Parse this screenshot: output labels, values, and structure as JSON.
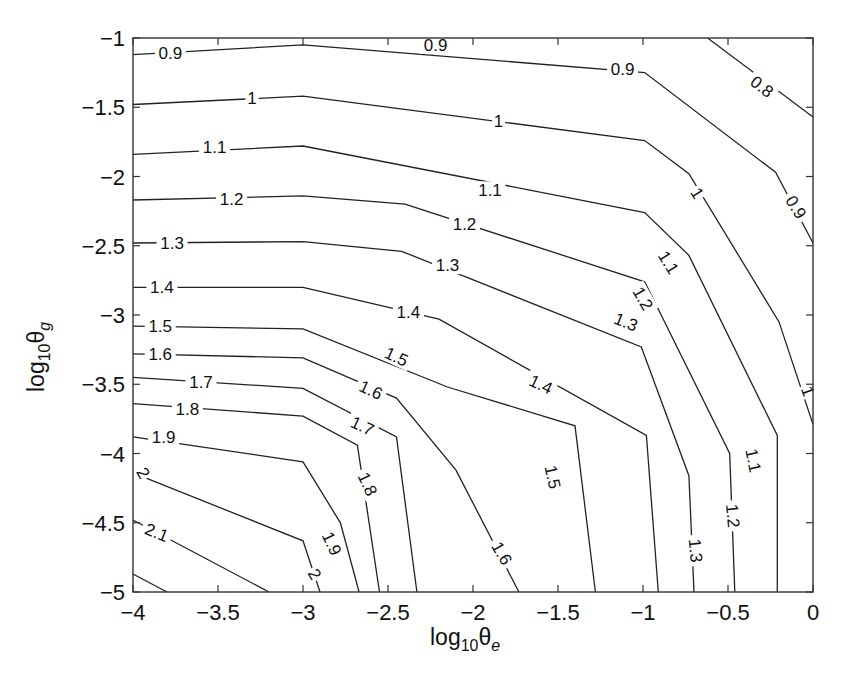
{
  "chart_data": {
    "type": "contour",
    "title": "",
    "xlabel": "log10 θe",
    "ylabel": "log10 θg",
    "xlim": [
      -4,
      0
    ],
    "ylim": [
      -5,
      -1
    ],
    "grid": false,
    "x_ticks": [
      -4,
      -3.5,
      -3,
      -2.5,
      -2,
      -1.5,
      -1,
      -0.5,
      0
    ],
    "x_tick_labels": [
      "−4",
      "−3.5",
      "−3",
      "−2.5",
      "−2",
      "−1.5",
      "−1",
      "−0.5",
      "0"
    ],
    "y_ticks": [
      -1,
      -1.5,
      -2,
      -2.5,
      -3,
      -3.5,
      -4,
      -4.5,
      -5
    ],
    "y_tick_labels": [
      "−1",
      "−1.5",
      "−2",
      "−2.5",
      "−3",
      "−3.5",
      "−4",
      "−4.5",
      "−5"
    ],
    "contour_levels": [
      0.8,
      0.9,
      1.0,
      1.1,
      1.2,
      1.3,
      1.4,
      1.5,
      1.6,
      1.7,
      1.8,
      1.9,
      2.0,
      2.1
    ],
    "contours": [
      {
        "level": 0.8,
        "label": "0.8",
        "points": [
          [
            -0.62,
            -1.0
          ],
          [
            0,
            -1.57
          ]
        ],
        "labels_at": [
          [
            -0.3,
            -1.35,
            38
          ]
        ]
      },
      {
        "level": 0.9,
        "label": "0.9",
        "points": [
          [
            -4,
            -1.12
          ],
          [
            -3,
            -1.05
          ],
          [
            -0.99,
            -1.25
          ],
          [
            -0.22,
            -1.97
          ],
          [
            0,
            -2.48
          ]
        ],
        "labels_at": [
          [
            -3.78,
            -1.11,
            0
          ],
          [
            -2.22,
            -1.05,
            0
          ],
          [
            -1.12,
            -1.22,
            0
          ],
          [
            -0.1,
            -2.22,
            58
          ]
        ]
      },
      {
        "level": 1.0,
        "label": "1",
        "points": [
          [
            -4,
            -1.48
          ],
          [
            -3,
            -1.42
          ],
          [
            -0.99,
            -1.74
          ],
          [
            -0.73,
            -1.98
          ],
          [
            -0.2,
            -3.05
          ],
          [
            0,
            -3.79
          ]
        ],
        "labels_at": [
          [
            -3.3,
            -1.43,
            0
          ],
          [
            -1.85,
            -1.6,
            0
          ],
          [
            -0.68,
            -2.12,
            58
          ],
          [
            -0.03,
            -3.55,
            70
          ]
        ]
      },
      {
        "level": 1.1,
        "label": "1.1",
        "points": [
          [
            -4,
            -1.84
          ],
          [
            -3,
            -1.78
          ],
          [
            -0.99,
            -2.26
          ],
          [
            -0.73,
            -2.57
          ],
          [
            -0.21,
            -3.87
          ],
          [
            -0.21,
            -5.0
          ]
        ],
        "labels_at": [
          [
            -3.52,
            -1.79,
            0
          ],
          [
            -1.9,
            -2.1,
            0
          ],
          [
            -0.85,
            -2.62,
            58
          ],
          [
            -0.35,
            -4.05,
            78
          ]
        ]
      },
      {
        "level": 1.2,
        "label": "1.2",
        "points": [
          [
            -4,
            -2.17
          ],
          [
            -3,
            -2.14
          ],
          [
            -2.4,
            -2.2
          ],
          [
            -0.99,
            -2.76
          ],
          [
            -0.49,
            -4.0
          ],
          [
            -0.46,
            -5.0
          ]
        ],
        "labels_at": [
          [
            -3.42,
            -2.16,
            0
          ],
          [
            -2.05,
            -2.34,
            0
          ],
          [
            -1.0,
            -2.88,
            60
          ],
          [
            -0.47,
            -4.45,
            85
          ]
        ]
      },
      {
        "level": 1.3,
        "label": "1.3",
        "points": [
          [
            -4,
            -2.48
          ],
          [
            -3,
            -2.47
          ],
          [
            -2.42,
            -2.54
          ],
          [
            -1.01,
            -3.23
          ],
          [
            -0.73,
            -4.16
          ],
          [
            -0.7,
            -5.0
          ]
        ],
        "labels_at": [
          [
            -3.77,
            -2.48,
            0
          ],
          [
            -2.15,
            -2.64,
            0
          ],
          [
            -1.1,
            -3.05,
            22
          ],
          [
            -0.69,
            -4.7,
            85
          ]
        ]
      },
      {
        "level": 1.4,
        "label": "1.4",
        "points": [
          [
            -4,
            -2.8
          ],
          [
            -3,
            -2.8
          ],
          [
            -2.2,
            -3.03
          ],
          [
            -0.98,
            -3.87
          ],
          [
            -0.91,
            -5.0
          ]
        ],
        "labels_at": [
          [
            -3.83,
            -2.8,
            0
          ],
          [
            -2.38,
            -2.98,
            0
          ],
          [
            -1.6,
            -3.5,
            25
          ]
        ]
      },
      {
        "level": 1.5,
        "label": "1.5",
        "points": [
          [
            -4,
            -3.08
          ],
          [
            -3,
            -3.1
          ],
          [
            -2.15,
            -3.52
          ],
          [
            -1.4,
            -3.8
          ],
          [
            -1.28,
            -5.0
          ]
        ],
        "labels_at": [
          [
            -3.84,
            -3.08,
            0
          ],
          [
            -2.45,
            -3.3,
            25
          ],
          [
            -1.53,
            -4.17,
            78
          ]
        ]
      },
      {
        "level": 1.6,
        "label": "1.6",
        "points": [
          [
            -4,
            -3.28
          ],
          [
            -3,
            -3.31
          ],
          [
            -2.45,
            -3.6
          ],
          [
            -2.1,
            -4.12
          ],
          [
            -1.73,
            -5.0
          ]
        ],
        "labels_at": [
          [
            -3.84,
            -3.28,
            0
          ],
          [
            -2.6,
            -3.54,
            25
          ],
          [
            -1.83,
            -4.72,
            60
          ]
        ]
      },
      {
        "level": 1.7,
        "label": "1.7",
        "points": [
          [
            -4,
            -3.45
          ],
          [
            -3,
            -3.53
          ],
          [
            -2.45,
            -3.88
          ],
          [
            -2.33,
            -5.0
          ]
        ],
        "labels_at": [
          [
            -3.6,
            -3.48,
            0
          ],
          [
            -2.65,
            -3.8,
            25
          ]
        ]
      },
      {
        "level": 1.8,
        "label": "1.8",
        "points": [
          [
            -4,
            -3.64
          ],
          [
            -3,
            -3.73
          ],
          [
            -2.68,
            -3.94
          ],
          [
            -2.55,
            -5.0
          ]
        ],
        "labels_at": [
          [
            -3.68,
            -3.68,
            0
          ],
          [
            -2.62,
            -4.22,
            65
          ]
        ]
      },
      {
        "level": 1.9,
        "label": "1.9",
        "points": [
          [
            -4,
            -3.88
          ],
          [
            -3,
            -4.06
          ],
          [
            -2.78,
            -4.5
          ],
          [
            -2.67,
            -5.0
          ]
        ],
        "labels_at": [
          [
            -3.82,
            -3.88,
            0
          ],
          [
            -2.83,
            -4.65,
            65
          ]
        ]
      },
      {
        "level": 2.0,
        "label": "2",
        "points": [
          [
            -4,
            -4.14
          ],
          [
            -3,
            -4.63
          ],
          [
            -2.9,
            -5.0
          ]
        ],
        "labels_at": [
          [
            -3.94,
            -4.14,
            60
          ],
          [
            -2.93,
            -4.87,
            60
          ]
        ]
      },
      {
        "level": 2.1,
        "label": "2.1",
        "points": [
          [
            -4,
            -4.48
          ],
          [
            -3.2,
            -5.0
          ]
        ],
        "labels_at": [
          [
            -3.86,
            -4.57,
            22
          ]
        ]
      },
      {
        "level": 2.2,
        "label": "",
        "points": [
          [
            -4,
            -4.87
          ],
          [
            -3.8,
            -5.0
          ]
        ],
        "labels_at": []
      }
    ]
  },
  "axes": {
    "xlabel_main": "log",
    "xlabel_sub": "10",
    "xlabel_sym": "θ",
    "xlabel_symsub": "e",
    "ylabel_main": "log",
    "ylabel_sub": "10",
    "ylabel_sym": "θ",
    "ylabel_symsub": "g"
  }
}
